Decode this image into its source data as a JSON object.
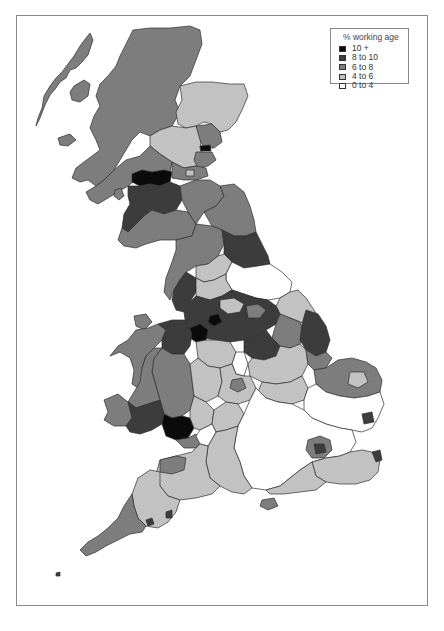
{
  "legend": {
    "title": "% working age",
    "items": [
      {
        "label": "10 +",
        "color": "#0b0b0b"
      },
      {
        "label": "8 to 10",
        "color": "#3c3c3c"
      },
      {
        "label": "6 to 8",
        "color": "#7d7d7d"
      },
      {
        "label": "4 to 6",
        "color": "#c2c2c2"
      },
      {
        "label": "0 to 4",
        "color": "#ffffff"
      }
    ]
  },
  "map": {
    "subject": "Great Britain local authority districts",
    "regions": [
      {
        "name": "scottish-highlands",
        "class": "6 to 8"
      },
      {
        "name": "outer-hebrides",
        "class": "6 to 8"
      },
      {
        "name": "aberdeenshire",
        "class": "4 to 6"
      },
      {
        "name": "perth-kinross",
        "class": "4 to 6"
      },
      {
        "name": "angus",
        "class": "6 to 8"
      },
      {
        "name": "dundee",
        "class": "10 +"
      },
      {
        "name": "argyll",
        "class": "6 to 8"
      },
      {
        "name": "glasgow-area",
        "class": "10 +"
      },
      {
        "name": "ayrshire-lanarkshire",
        "class": "8 to 10"
      },
      {
        "name": "dumfries-galloway",
        "class": "6 to 8"
      },
      {
        "name": "scottish-borders",
        "class": "6 to 8"
      },
      {
        "name": "northumberland",
        "class": "6 to 8"
      },
      {
        "name": "cumbria",
        "class": "6 to 8"
      },
      {
        "name": "durham-teesside",
        "class": "8 to 10"
      },
      {
        "name": "north-yorkshire",
        "class": "0 to 4"
      },
      {
        "name": "east-riding",
        "class": "4 to 6"
      },
      {
        "name": "lancashire-manchester",
        "class": "8 to 10"
      },
      {
        "name": "merseyside",
        "class": "10 +"
      },
      {
        "name": "lincolnshire-east",
        "class": "8 to 10"
      },
      {
        "name": "north-wales",
        "class": "6 to 8"
      },
      {
        "name": "wales-north-east",
        "class": "8 to 10"
      },
      {
        "name": "mid-wales",
        "class": "6 to 8"
      },
      {
        "name": "south-west-wales",
        "class": "8 to 10"
      },
      {
        "name": "south-wales-valleys",
        "class": "10 +"
      },
      {
        "name": "west-midlands",
        "class": "4 to 6"
      },
      {
        "name": "east-midlands",
        "class": "4 to 6"
      },
      {
        "name": "norfolk",
        "class": "6 to 8"
      },
      {
        "name": "suffolk-essex",
        "class": "0 to 4"
      },
      {
        "name": "south-east-home-counties",
        "class": "0 to 4"
      },
      {
        "name": "london",
        "class": "mixed"
      },
      {
        "name": "kent",
        "class": "4 to 6"
      },
      {
        "name": "wiltshire-hampshire",
        "class": "4 to 6"
      },
      {
        "name": "somerset-dorset",
        "class": "4 to 6"
      },
      {
        "name": "devon",
        "class": "4 to 6"
      },
      {
        "name": "cornwall",
        "class": "6 to 8"
      }
    ]
  }
}
